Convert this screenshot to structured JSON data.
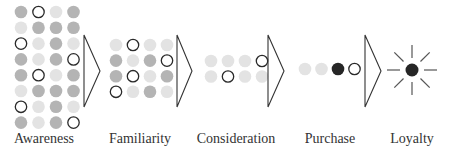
{
  "diagram": {
    "type": "marketing-funnel",
    "colors": {
      "dark_gray": "#b4b4b4",
      "light_gray": "#e3e3e3",
      "outline_stroke": "#2a2a2a",
      "black": "#262626",
      "chevron_stroke": "#333333",
      "label": "#333333"
    },
    "stages": [
      {
        "id": "awareness",
        "label": "Awareness",
        "label_x": 44,
        "grid": {
          "x0": 21,
          "y0": 12,
          "dx": 17.5,
          "dy": 15.8,
          "rows": [
            [
              "dark",
              "outline",
              "light",
              "dark"
            ],
            [
              "light",
              "dark",
              "dark",
              "dark"
            ],
            [
              "outline",
              "light",
              "dark",
              "light"
            ],
            [
              "dark",
              "light",
              "dark",
              "outline"
            ],
            [
              "dark",
              "outline",
              "light",
              "dark"
            ],
            [
              "light",
              "dark",
              "dark",
              "dark"
            ],
            [
              "outline",
              "light",
              "dark",
              "light"
            ],
            [
              "dark",
              "light",
              "dark",
              "outline"
            ]
          ]
        }
      },
      {
        "id": "familiarity",
        "label": "Familiarity",
        "label_x": 140,
        "grid": {
          "x0": 116,
          "y0": 45,
          "dx": 17,
          "dy": 15.6,
          "rows": [
            [
              "light",
              "outline",
              "light",
              "light"
            ],
            [
              "dark",
              "light",
              "dark",
              "outline"
            ],
            [
              "dark",
              "outline",
              "light",
              "dark"
            ],
            [
              "outline",
              "light",
              "dark",
              "light"
            ]
          ]
        }
      },
      {
        "id": "consideration",
        "label": "Consideration",
        "label_x": 236,
        "grid": {
          "x0": 211,
          "y0": 61,
          "dx": 17,
          "dy": 15.5,
          "rows": [
            [
              "light",
              "light",
              "light",
              "outline"
            ],
            [
              "light",
              "outline",
              "light",
              "light"
            ]
          ]
        }
      },
      {
        "id": "purchase",
        "label": "Purchase",
        "label_x": 330,
        "grid": {
          "x0": 305,
          "y0": 69,
          "dx": 16.5,
          "dy": 15.5,
          "rows": [
            [
              "light",
              "light",
              "black",
              "outline"
            ]
          ]
        }
      },
      {
        "id": "loyalty",
        "label": "Loyalty",
        "label_x": 412,
        "sun": {
          "cx": 412,
          "cy": 70,
          "r": 6.5,
          "ray_inner": 12,
          "ray_outer": 25,
          "rays": 8
        }
      }
    ],
    "chevrons": [
      {
        "x_left": 84,
        "x_tip": 100,
        "y_top": 35,
        "y_bottom": 107
      },
      {
        "x_left": 177,
        "x_tip": 192,
        "y_top": 35,
        "y_bottom": 107
      },
      {
        "x_left": 268,
        "x_tip": 284,
        "y_top": 35,
        "y_bottom": 107
      },
      {
        "x_left": 365,
        "x_tip": 381,
        "y_top": 35,
        "y_bottom": 107
      }
    ],
    "circle_radius": 6.3
  }
}
